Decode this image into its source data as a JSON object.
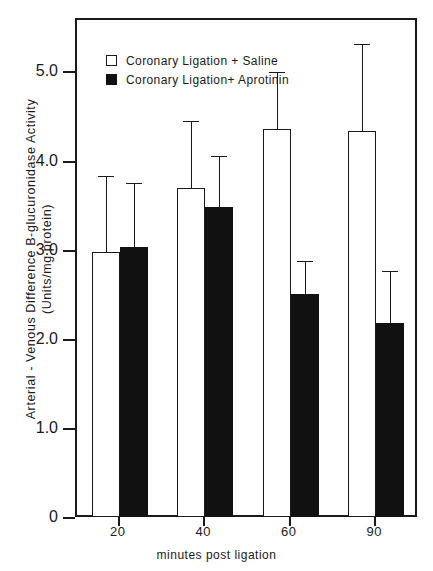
{
  "chart_data": {
    "type": "bar",
    "title": "",
    "subtitle": "",
    "xlabel": "minutes post ligation",
    "ylabel": "Arterial - Venous  Difference  B-glucuronidase  Activity",
    "ylabel_line2": "(Units/mg protein)",
    "categories": [
      "20",
      "40",
      "60",
      "90"
    ],
    "ylim": [
      0,
      5.6
    ],
    "yticks": [
      0,
      1.0,
      2.0,
      3.0,
      4.0,
      5.0
    ],
    "ytick_labels": [
      "0",
      "1.0",
      "2.0",
      "3.0",
      "4.0",
      "5.0"
    ],
    "grid": false,
    "legend_position": "top-left",
    "series": [
      {
        "name": "Coronary Ligation + Saline",
        "style": "open",
        "color": "#ffffff",
        "edge_color": "#1a1a1a",
        "values": [
          3.0,
          3.72,
          4.38,
          4.35
        ],
        "error_upper": [
          3.85,
          4.47,
          5.02,
          5.33
        ]
      },
      {
        "name": "Coronary Ligation+ Aprotinin",
        "style": "filled",
        "color": "#111111",
        "edge_color": "#111111",
        "values": [
          3.05,
          3.5,
          2.52,
          2.2
        ],
        "error_upper": [
          3.77,
          4.07,
          2.9,
          2.78
        ]
      }
    ]
  },
  "legend": {
    "items": [
      {
        "label": "Coronary Ligation + Saline",
        "style": "open"
      },
      {
        "label": "Coronary Ligation+ Aprotinin",
        "style": "filled"
      }
    ]
  }
}
